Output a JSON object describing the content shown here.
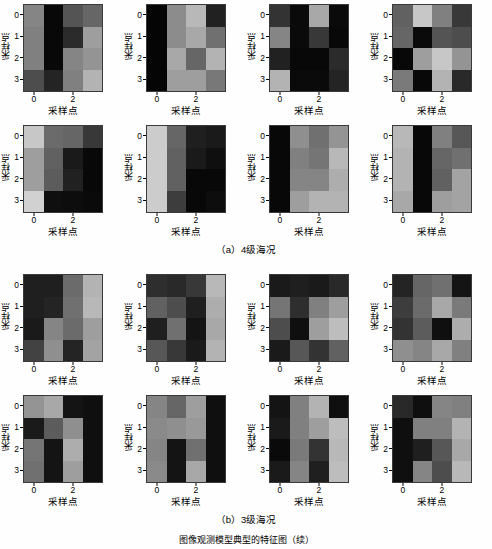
{
  "figure": {
    "axis_label_x": "采样点",
    "axis_label_y": "采样点",
    "xticks": [
      "0",
      "2"
    ],
    "yticks": [
      "0",
      "1",
      "2",
      "3"
    ],
    "colormap": "gray",
    "value_range": [
      0,
      1
    ],
    "groups": [
      {
        "id": "a",
        "caption": "（a）4级海况"
      },
      {
        "id": "b",
        "caption": "（b）3级海况"
      }
    ]
  },
  "chart_data": {
    "type": "heatmap",
    "title": "",
    "xlabel": "采样点",
    "ylabel": "采样点",
    "xtick_labels": [
      "0",
      "2"
    ],
    "xtick_positions": [
      0,
      2
    ],
    "ytick_labels": [
      "0",
      "1",
      "2",
      "3"
    ],
    "ytick_positions": [
      0,
      1,
      2,
      3
    ],
    "colormap": "gray",
    "grid": false,
    "legend": "none",
    "rows": 4,
    "cols": 4,
    "panel_layout": {
      "rows": 4,
      "cols": 4,
      "groups": 2,
      "panels_per_group": 8
    },
    "panels": [
      {
        "group": "a",
        "index": 1,
        "values": [
          [
            0.52,
            0.03,
            0.33,
            0.4
          ],
          [
            0.5,
            0.03,
            0.17,
            0.62
          ],
          [
            0.5,
            0.03,
            0.52,
            0.58
          ],
          [
            0.3,
            0.14,
            0.5,
            0.7
          ]
        ]
      },
      {
        "group": "a",
        "index": 2,
        "values": [
          [
            0.02,
            0.55,
            0.72,
            0.13
          ],
          [
            0.02,
            0.55,
            0.66,
            0.44
          ],
          [
            0.02,
            0.66,
            0.4,
            0.7
          ],
          [
            0.02,
            0.62,
            0.62,
            0.47
          ]
        ]
      },
      {
        "group": "a",
        "index": 3,
        "values": [
          [
            0.2,
            0.04,
            0.66,
            0.04
          ],
          [
            0.52,
            0.04,
            0.22,
            0.03
          ],
          [
            0.13,
            0.03,
            0.03,
            0.17
          ],
          [
            0.7,
            0.04,
            0.04,
            0.14
          ]
        ]
      },
      {
        "group": "a",
        "index": 4,
        "values": [
          [
            0.38,
            0.78,
            0.5,
            0.22
          ],
          [
            0.4,
            0.04,
            0.33,
            0.3
          ],
          [
            0.03,
            0.62,
            0.78,
            0.58
          ],
          [
            0.48,
            0.03,
            0.7,
            0.16
          ]
        ]
      },
      {
        "group": "a",
        "index": 5,
        "values": [
          [
            0.78,
            0.42,
            0.4,
            0.22
          ],
          [
            0.62,
            0.38,
            0.1,
            0.03
          ],
          [
            0.62,
            0.36,
            0.13,
            0.03
          ],
          [
            0.82,
            0.06,
            0.05,
            0.04
          ]
        ]
      },
      {
        "group": "a",
        "index": 6,
        "values": [
          [
            0.8,
            0.4,
            0.12,
            0.1
          ],
          [
            0.8,
            0.38,
            0.1,
            0.06
          ],
          [
            0.8,
            0.38,
            0.03,
            0.03
          ],
          [
            0.8,
            0.24,
            0.03,
            0.05
          ]
        ]
      },
      {
        "group": "a",
        "index": 7,
        "values": [
          [
            0.03,
            0.56,
            0.44,
            0.58
          ],
          [
            0.03,
            0.5,
            0.46,
            0.72
          ],
          [
            0.03,
            0.52,
            0.52,
            0.68
          ],
          [
            0.03,
            0.62,
            0.7,
            0.7
          ]
        ]
      },
      {
        "group": "a",
        "index": 8,
        "values": [
          [
            0.72,
            0.03,
            0.5,
            0.34
          ],
          [
            0.7,
            0.03,
            0.4,
            0.44
          ],
          [
            0.7,
            0.03,
            0.38,
            0.64
          ],
          [
            0.66,
            0.03,
            0.62,
            0.64
          ]
        ]
      },
      {
        "group": "b",
        "index": 1,
        "values": [
          [
            0.12,
            0.12,
            0.42,
            0.7
          ],
          [
            0.12,
            0.14,
            0.44,
            0.72
          ],
          [
            0.1,
            0.52,
            0.42,
            0.62
          ],
          [
            0.26,
            0.56,
            0.14,
            0.64
          ]
        ]
      },
      {
        "group": "b",
        "index": 2,
        "values": [
          [
            0.18,
            0.16,
            0.22,
            0.72
          ],
          [
            0.38,
            0.3,
            0.12,
            0.68
          ],
          [
            0.12,
            0.44,
            0.08,
            0.66
          ],
          [
            0.34,
            0.22,
            0.1,
            0.7
          ]
        ]
      },
      {
        "group": "b",
        "index": 3,
        "values": [
          [
            0.1,
            0.12,
            0.1,
            0.16
          ],
          [
            0.46,
            0.18,
            0.5,
            0.62
          ],
          [
            0.3,
            0.06,
            0.62,
            0.74
          ],
          [
            0.1,
            0.34,
            0.2,
            0.38
          ]
        ]
      },
      {
        "group": "b",
        "index": 4,
        "values": [
          [
            0.14,
            0.4,
            0.44,
            0.08
          ],
          [
            0.24,
            0.42,
            0.66,
            0.48
          ],
          [
            0.2,
            0.36,
            0.06,
            0.68
          ],
          [
            0.56,
            0.52,
            0.66,
            0.5
          ]
        ]
      },
      {
        "group": "b",
        "index": 5,
        "values": [
          [
            0.58,
            0.66,
            0.08,
            0.06
          ],
          [
            0.1,
            0.36,
            0.56,
            0.06
          ],
          [
            0.46,
            0.08,
            0.68,
            0.06
          ],
          [
            0.44,
            0.08,
            0.62,
            0.06
          ]
        ]
      },
      {
        "group": "b",
        "index": 6,
        "values": [
          [
            0.52,
            0.4,
            0.62,
            0.06
          ],
          [
            0.54,
            0.56,
            0.6,
            0.06
          ],
          [
            0.52,
            0.08,
            0.44,
            0.06
          ],
          [
            0.54,
            0.08,
            0.66,
            0.06
          ]
        ]
      },
      {
        "group": "b",
        "index": 7,
        "values": [
          [
            0.08,
            0.5,
            0.7,
            0.06
          ],
          [
            0.1,
            0.5,
            0.62,
            0.74
          ],
          [
            0.04,
            0.48,
            0.2,
            0.72
          ],
          [
            0.1,
            0.52,
            0.12,
            0.74
          ]
        ]
      },
      {
        "group": "b",
        "index": 8,
        "values": [
          [
            0.16,
            0.06,
            0.52,
            0.5
          ],
          [
            0.06,
            0.5,
            0.5,
            0.7
          ],
          [
            0.06,
            0.12,
            0.34,
            0.66
          ],
          [
            0.06,
            0.52,
            0.3,
            0.72
          ]
        ]
      }
    ]
  },
  "bottom_text": {
    "partial_caption": "图像观测模型典型的特征图（续）"
  }
}
